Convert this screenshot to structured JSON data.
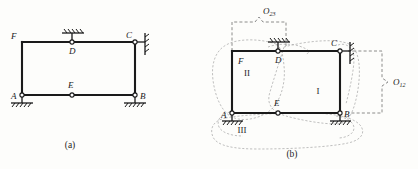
{
  "figure": {
    "captions": {
      "a": "(a)",
      "b": "(b)"
    }
  },
  "colors": {
    "member": "#1a1a1a",
    "ground": "#1a1a1a",
    "dashed_bracket": "#6e6e6e",
    "blob_outline": "#a9a9a9",
    "background": "#fdfdfb",
    "text": "#1b1b1b"
  },
  "panel_a": {
    "caption": "(a)",
    "joints": [
      {
        "id": "A",
        "label": "A",
        "x": 22,
        "y": 95,
        "label_x": 11,
        "label_y": 99,
        "marker": "circle"
      },
      {
        "id": "B",
        "label": "B",
        "x": 135,
        "y": 95,
        "label_x": 140,
        "label_y": 99,
        "marker": "circle"
      },
      {
        "id": "C",
        "label": "C",
        "x": 135,
        "y": 42,
        "label_x": 126,
        "label_y": 38,
        "marker": "circle"
      },
      {
        "id": "D",
        "label": "D",
        "x": 72,
        "y": 42,
        "label_x": 69,
        "label_y": 54,
        "marker": "circle"
      },
      {
        "id": "E",
        "label": "E",
        "x": 72,
        "y": 95,
        "label_x": 68,
        "label_y": 87,
        "marker": "circle"
      },
      {
        "id": "F",
        "label": "F",
        "x": 22,
        "y": 42,
        "label_x": 12,
        "label_y": 39,
        "marker": "none"
      }
    ],
    "members": [
      {
        "name": "member-F-D",
        "from": "F",
        "to": "D"
      },
      {
        "name": "member-D-C",
        "from": "D",
        "to": "C"
      },
      {
        "name": "member-F-A",
        "from": "F",
        "to": "A"
      },
      {
        "name": "member-C-B",
        "from": "C",
        "to": "B"
      },
      {
        "name": "member-A-E",
        "from": "A",
        "to": "E"
      },
      {
        "name": "member-E-B",
        "from": "E",
        "to": "B"
      }
    ],
    "supports": [
      {
        "name": "support-A",
        "at": "A",
        "type": "fixed-hatched-ground",
        "orientation": "bottom"
      },
      {
        "name": "support-B",
        "at": "B",
        "type": "fixed-hatched-ground",
        "orientation": "bottom"
      },
      {
        "name": "support-D",
        "at": "D",
        "type": "fixed-hatched-ground",
        "orientation": "top"
      },
      {
        "name": "support-C",
        "at": "C",
        "type": "fixed-hatched-wall",
        "orientation": "right"
      }
    ]
  },
  "panel_b": {
    "caption": "(b)",
    "joints": [
      {
        "id": "A",
        "label": "A",
        "x": 232,
        "y": 113,
        "label_x": 221,
        "label_y": 118,
        "marker": "circle"
      },
      {
        "id": "B",
        "label": "B",
        "x": 340,
        "y": 113,
        "label_x": 344,
        "label_y": 117,
        "marker": "circle"
      },
      {
        "id": "C",
        "label": "C",
        "x": 340,
        "y": 51,
        "label_x": 330,
        "label_y": 46,
        "marker": "circle"
      },
      {
        "id": "D",
        "label": "D",
        "x": 278,
        "y": 51,
        "label_x": 275,
        "label_y": 62,
        "marker": "circle"
      },
      {
        "id": "E",
        "label": "E",
        "x": 278,
        "y": 113,
        "label_x": 274,
        "label_y": 105,
        "marker": "circle"
      },
      {
        "id": "F",
        "label": "F",
        "x": 232,
        "y": 51,
        "label_x": 239,
        "label_y": 63,
        "marker": "none"
      }
    ],
    "members": [
      {
        "name": "member-F-D",
        "from": "F",
        "to": "D"
      },
      {
        "name": "member-D-C",
        "from": "D",
        "to": "C"
      },
      {
        "name": "member-F-A",
        "from": "F",
        "to": "A"
      },
      {
        "name": "member-C-B",
        "from": "C",
        "to": "B"
      },
      {
        "name": "member-A-E",
        "from": "A",
        "to": "E"
      },
      {
        "name": "member-E-B",
        "from": "E",
        "to": "B"
      }
    ],
    "supports": [
      {
        "name": "support-A",
        "at": "A",
        "type": "fixed-hatched-ground",
        "orientation": "bottom"
      },
      {
        "name": "support-B",
        "at": "B",
        "type": "fixed-hatched-ground",
        "orientation": "bottom"
      },
      {
        "name": "support-D",
        "at": "D",
        "type": "fixed-hatched-ground",
        "orientation": "top"
      },
      {
        "name": "support-C",
        "at": "C",
        "type": "fixed-hatched-wall",
        "orientation": "right"
      }
    ],
    "rigid_discs": [
      {
        "name": "disc-I",
        "label": "I",
        "x": 318,
        "y": 94
      },
      {
        "name": "disc-II",
        "label": "II",
        "x": 247,
        "y": 76
      },
      {
        "name": "disc-III",
        "label": "III",
        "x": 242,
        "y": 131
      }
    ],
    "instant_centers": [
      {
        "name": "instant-center-O23",
        "label": "O",
        "subscript": "23",
        "label_x": 265,
        "label_y": 15,
        "bracket": "top"
      },
      {
        "name": "instant-center-O12",
        "label": "O",
        "subscript": "12",
        "label_x": 396,
        "label_y": 85,
        "bracket": "right"
      }
    ]
  }
}
